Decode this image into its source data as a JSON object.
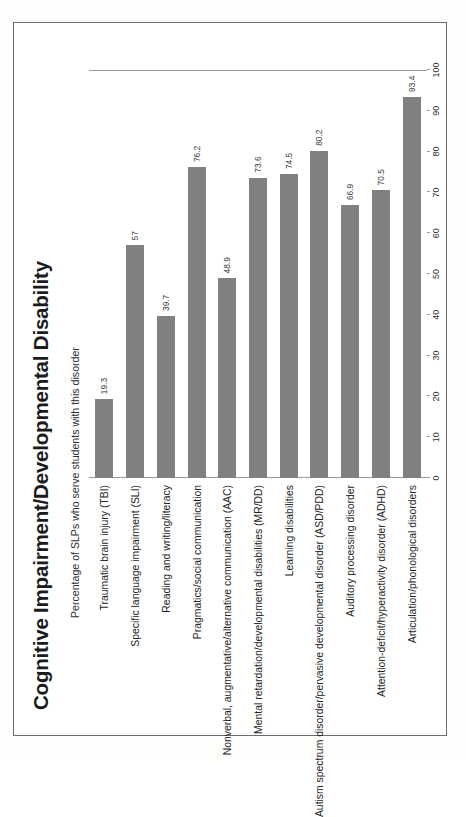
{
  "chart_data": {
    "type": "bar",
    "orientation": "vertical",
    "title": "Cognitive Impairment/Developmental Disability",
    "xlabel": "",
    "ylabel": "Percentage of SLPs who serve students with this disorder",
    "ylim": [
      0,
      100
    ],
    "ytick_step": 10,
    "yticks": [
      "0",
      "10",
      "20",
      "30",
      "40",
      "50",
      "60",
      "70",
      "80",
      "90",
      "100"
    ],
    "grid": false,
    "legend": false,
    "bar_color": "#808080",
    "categories": [
      "Traumatic brain injury (TBI)",
      "Specific language impairment (SLI)",
      "Reading and writing/literacy",
      "Pragmatics/social communication",
      "Nonverbal, augmentative/alternative communication (AAC)",
      "Mental retardation/developmental disabilities (MR/DD)",
      "Learning disabilities",
      "Autism spectrum disorder/pervasive developmental disorder (ASD/PDD)",
      "Auditory processing disorder",
      "Attention-deficit/hyperactivity disorder (ADHD)",
      "Articulation/phonological disorders"
    ],
    "values": [
      19.3,
      57,
      39.7,
      76.2,
      48.9,
      73.6,
      74.5,
      80.2,
      66.9,
      70.5,
      93.4
    ],
    "value_labels": [
      "19.3",
      "57",
      "39.7",
      "76.2",
      "48.9",
      "73.6",
      "74.5",
      "80.2",
      "66.9",
      "70.5",
      "93.4"
    ]
  },
  "page": {
    "rotation_note": "chart rendered rotated 90 degrees counter-clockwise on the page"
  }
}
